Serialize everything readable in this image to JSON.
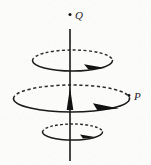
{
  "figure": {
    "background_color": "#fbfbfa",
    "ink_color": "#1a1a1a",
    "width": 151,
    "height": 165,
    "axis": {
      "name": "current-wire",
      "orientation": "vertical",
      "x": 70,
      "y_top": 29,
      "y_bottom": 161,
      "stroke_width": 1.6,
      "arrow": {
        "direction": "up",
        "tip_x": 70,
        "tip_y": 88,
        "base_y": 110,
        "half_width": 3.2
      }
    },
    "points": [
      {
        "label": "Q",
        "name": "point-q",
        "dot_x": 70,
        "dot_y": 14.5,
        "label_x": 75,
        "label_y": 18,
        "position": "above the wire, on the axis"
      },
      {
        "label": "P",
        "name": "point-p",
        "dot_x": 129,
        "dot_y": 96,
        "label_x": 134,
        "label_y": 100,
        "position": "on the right edge of the middle loop"
      }
    ],
    "loops": [
      {
        "name": "upper-loop",
        "order": 1,
        "cx": 72.5,
        "cy": 60.5,
        "rx": 40,
        "ry": 10.5,
        "stroke_width": 1.5,
        "dash_pattern": "3 2.4",
        "back_half": "dashed",
        "front_half": "solid",
        "arrow": {
          "direction": "clockwise-viewed-from-above",
          "tip_x": 104,
          "tip_y": 68,
          "tail_x": 82,
          "tail_y": 64.5
        }
      },
      {
        "name": "middle-loop",
        "order": 2,
        "cx": 71.5,
        "cy": 98.5,
        "rx": 58,
        "ry": 13.5,
        "stroke_width": 1.6,
        "dash_pattern": "3.2 2.6",
        "back_half": "dashed",
        "front_half": "solid",
        "arrow": {
          "direction": "clockwise-viewed-from-above",
          "tip_x": 117,
          "tip_y": 108,
          "tail_x": 92,
          "tail_y": 104
        }
      },
      {
        "name": "lower-loop",
        "order": 3,
        "cx": 72.5,
        "cy": 132,
        "rx": 30,
        "ry": 8,
        "stroke_width": 1.5,
        "dash_pattern": "2.8 2.2",
        "back_half": "dashed",
        "front_half": "solid",
        "arrow": {
          "direction": "clockwise-viewed-from-above",
          "tip_x": 95,
          "tip_y": 137,
          "tail_x": 79,
          "tail_y": 135
        }
      }
    ]
  }
}
